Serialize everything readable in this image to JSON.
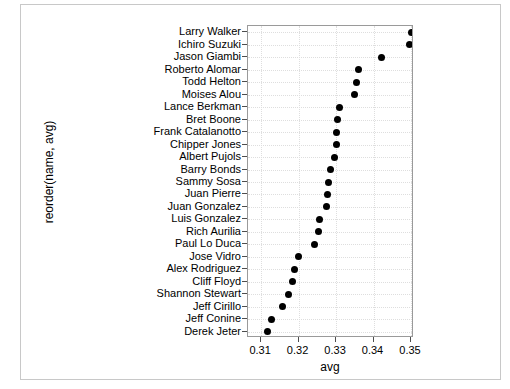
{
  "chart_data": {
    "type": "scatter",
    "title": "",
    "xlabel": "avg",
    "ylabel": "reorder(name, avg)",
    "xlim": [
      0.3065,
      0.3508
    ],
    "xticks": [
      0.31,
      0.32,
      0.33,
      0.34,
      0.35
    ],
    "xticklabels": [
      "0.31",
      "0.32",
      "0.33",
      "0.34",
      "0.35"
    ],
    "grid": "dotted, horizontal and vertical",
    "legend": "none",
    "orientation": "horizontal dot plot, sorted ascending from bottom",
    "categories": [
      "Larry Walker",
      "Ichiro Suzuki",
      "Jason Giambi",
      "Roberto Alomar",
      "Todd Helton",
      "Moises Alou",
      "Lance Berkman",
      "Bret Boone",
      "Frank Catalanotto",
      "Chipper Jones",
      "Albert Pujols",
      "Barry Bonds",
      "Sammy Sosa",
      "Juan Pierre",
      "Juan Gonzalez",
      "Luis Gonzalez",
      "Rich Aurilia",
      "Paul Lo Duca",
      "Jose Vidro",
      "Alex Rodriguez",
      "Cliff Floyd",
      "Shannon Stewart",
      "Jeff Cirillo",
      "Jeff Conine",
      "Derek Jeter"
    ],
    "values": [
      0.35,
      0.3495,
      0.342,
      0.336,
      0.3355,
      0.335,
      0.331,
      0.3305,
      0.33,
      0.33,
      0.3295,
      0.3285,
      0.328,
      0.3277,
      0.3275,
      0.3257,
      0.3253,
      0.3243,
      0.32,
      0.319,
      0.3185,
      0.3172,
      0.3157,
      0.3128,
      0.3117
    ]
  }
}
